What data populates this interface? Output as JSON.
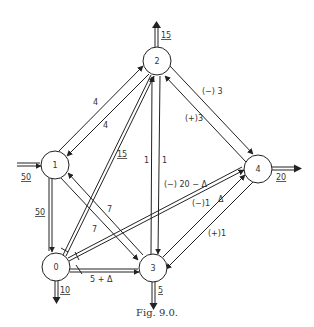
{
  "figure": {
    "caption": "Fig. 9.0."
  },
  "nodes": [
    {
      "id": "0",
      "label": "0",
      "x": 56,
      "y": 267
    },
    {
      "id": "1",
      "label": "1",
      "x": 55,
      "y": 165
    },
    {
      "id": "2",
      "label": "2",
      "x": 157,
      "y": 61
    },
    {
      "id": "3",
      "label": "3",
      "x": 153,
      "y": 268
    },
    {
      "id": "4",
      "label": "4",
      "x": 258,
      "y": 169
    }
  ],
  "external_flows": {
    "into_1": {
      "label": "50",
      "underlined": true
    },
    "out_of_2": {
      "label": "15",
      "underlined": true
    },
    "out_of_4": {
      "label": "20",
      "underlined": true
    },
    "out_of_0": {
      "label": "10",
      "underlined": true
    },
    "out_of_3": {
      "label": "5",
      "underlined": true
    }
  },
  "edge_labels": {
    "e_1_2": "4",
    "e_2_1": "4",
    "e_0_2": "15",
    "e_3_2": "1",
    "e_2_3": "1",
    "e_2_4": "(−) 3",
    "e_4_2": "(+)3",
    "e_1_0": "50",
    "e_1_3": "7",
    "e_3_1": "7",
    "e_0_4": "(−) 20 − Δ",
    "e_3_4_a": "(−)1",
    "e_3_4_delta": "Δ",
    "e_4_3": "(+)1",
    "e_0_3": "5 + Δ"
  }
}
